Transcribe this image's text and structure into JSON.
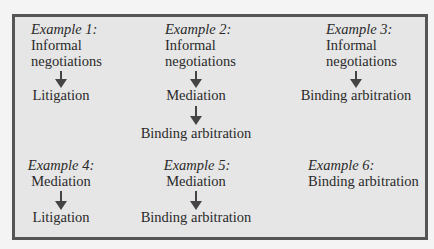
{
  "examples": [
    {
      "label": "Example 1:",
      "steps": [
        "Informal",
        "negotiations",
        "Litigation"
      ]
    },
    {
      "label": "Example 2:",
      "steps": [
        "Informal",
        "negotiations",
        "Mediation",
        "Binding arbitration"
      ]
    },
    {
      "label": "Example 3:",
      "steps": [
        "Informal",
        "negotiations",
        "Binding arbitration"
      ]
    },
    {
      "label": "Example 4:",
      "steps": [
        "Mediation",
        "Litigation"
      ]
    },
    {
      "label": "Example 5:",
      "steps": [
        "Mediation",
        "Binding arbitration"
      ]
    },
    {
      "label": "Example 6:",
      "steps": [
        "Binding arbitration"
      ]
    }
  ],
  "colors": {
    "box_fill": "#e6e6e6",
    "border": "#555555",
    "arrow": "#444444",
    "text": "#2a2a2a"
  }
}
